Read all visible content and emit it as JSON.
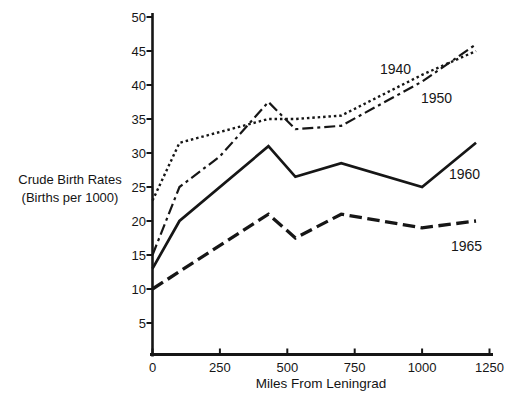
{
  "figure": {
    "background": "#ffffff",
    "ink_color": "#161616"
  },
  "chart_data": {
    "type": "line",
    "title": "",
    "xlabel": "Miles From Leningrad",
    "ylabel_lines": [
      "Crude Birth Rates",
      "(Births per 1000)"
    ],
    "x_ticks": [
      0,
      250,
      500,
      750,
      1000,
      1250
    ],
    "y_ticks": [
      5,
      10,
      15,
      20,
      25,
      30,
      35,
      40,
      45,
      50
    ],
    "xlim": [
      0,
      1250
    ],
    "ylim": [
      0,
      50
    ],
    "grid": false,
    "legend_position": "inline-labels-right-of-lines",
    "series": [
      {
        "name": "1940",
        "line_style": "dotted",
        "color": "#161616",
        "points": [
          [
            0,
            23
          ],
          [
            100,
            31.5
          ],
          [
            430,
            35
          ],
          [
            530,
            35
          ],
          [
            700,
            35.5
          ],
          [
            1000,
            41.5
          ],
          [
            1200,
            45
          ]
        ],
        "label_px": [
          380,
          74
        ]
      },
      {
        "name": "1950",
        "line_style": "dash-dot",
        "color": "#161616",
        "points": [
          [
            0,
            15
          ],
          [
            100,
            25
          ],
          [
            250,
            29.5
          ],
          [
            430,
            37.5
          ],
          [
            530,
            33.5
          ],
          [
            700,
            34
          ],
          [
            1000,
            40.5
          ],
          [
            1200,
            46
          ]
        ],
        "label_px": [
          421,
          103
        ]
      },
      {
        "name": "1960",
        "line_style": "solid",
        "color": "#161616",
        "points": [
          [
            0,
            13
          ],
          [
            100,
            20
          ],
          [
            430,
            31
          ],
          [
            530,
            26.5
          ],
          [
            700,
            28.5
          ],
          [
            1000,
            25
          ],
          [
            1200,
            31.5
          ]
        ],
        "label_px": [
          449,
          179
        ]
      },
      {
        "name": "1965",
        "line_style": "dashed",
        "color": "#161616",
        "points": [
          [
            0,
            10
          ],
          [
            430,
            21
          ],
          [
            530,
            17.5
          ],
          [
            700,
            21
          ],
          [
            1000,
            19
          ],
          [
            1200,
            20
          ]
        ],
        "label_px": [
          451,
          251
        ]
      }
    ]
  }
}
